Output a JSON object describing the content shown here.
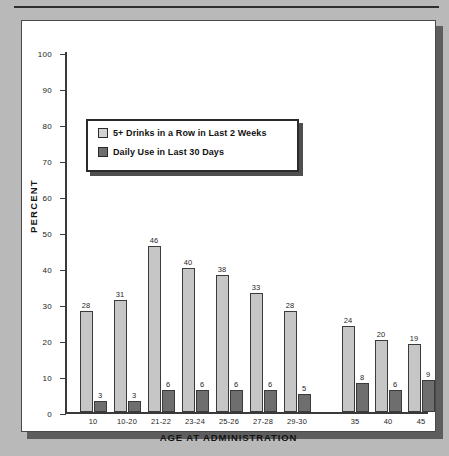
{
  "chart_data": {
    "type": "bar",
    "title": "",
    "xlabel": "AGE AT ADMINISTRATION",
    "ylabel": "PERCENT",
    "ylim": [
      0,
      100
    ],
    "ytick_labels": [
      "100",
      "90",
      "80",
      "70",
      "60",
      "50",
      "40",
      "30",
      "20",
      "10",
      "0"
    ],
    "yticks": [
      100,
      90,
      80,
      70,
      60,
      50,
      40,
      30,
      20,
      10,
      0
    ],
    "grid": false,
    "legend_position": "upper-left-inside",
    "categories": [
      "10",
      "10-20",
      "21-22",
      "23-24",
      "25-26",
      "27-28",
      "29-30",
      "35",
      "40",
      "45"
    ],
    "series": [
      {
        "name": "5+ Drinks in a Row in Last 2 Weeks",
        "color": "#c6c6c6",
        "values": [
          28,
          31,
          46,
          40,
          38,
          33,
          28,
          24,
          20,
          19
        ]
      },
      {
        "name": "Daily Use in Last 30 Days",
        "color": "#6e6e6e",
        "values": [
          3,
          3,
          6,
          6,
          6,
          6,
          5,
          8,
          6,
          9
        ]
      }
    ]
  },
  "legend": {
    "items": [
      {
        "label": "5+ Drinks in a Row in Last 2 Weeks",
        "swatch": "light"
      },
      {
        "label": "Daily Use in Last 30 Days",
        "swatch": "dark"
      }
    ]
  }
}
